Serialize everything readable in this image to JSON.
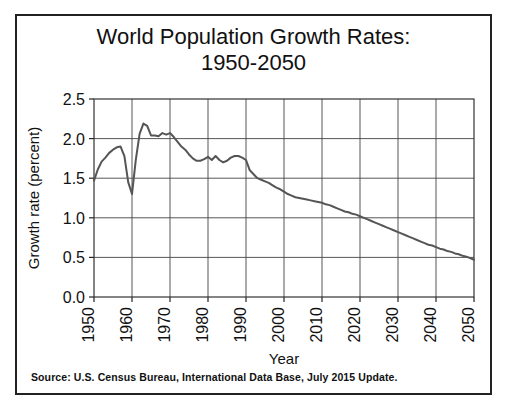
{
  "figure": {
    "title_line1": "World Population Growth Rates:",
    "title_line2": "1950-2050",
    "source_note": "Source: U.S. Census Bureau, International Data Base, July 2015 Update.",
    "frame_color": "#222222",
    "background_color": "#ffffff"
  },
  "chart_data": {
    "type": "line",
    "xlabel": "Year",
    "ylabel": "Growth rate (percent)",
    "xlim": [
      1950,
      2050
    ],
    "ylim": [
      0.0,
      2.5
    ],
    "grid": true,
    "legend": "none",
    "line_color": "#555555",
    "line_width": 2,
    "xticks": [
      1950,
      1960,
      1970,
      1980,
      1990,
      2000,
      2010,
      2020,
      2030,
      2040,
      2050
    ],
    "xtick_labels": [
      "1950",
      "1960",
      "1970",
      "1980",
      "1990",
      "2000",
      "2010",
      "2020",
      "2030",
      "2040",
      "2050"
    ],
    "xtick_rotation": 90,
    "yticks": [
      0.0,
      0.5,
      1.0,
      1.5,
      2.0,
      2.5
    ],
    "ytick_labels": [
      "0.0",
      "0.5",
      "1.0",
      "1.5",
      "2.0",
      "2.5"
    ],
    "series": [
      {
        "name": "World population growth rate",
        "x": [
          1950,
          1951,
          1952,
          1953,
          1954,
          1955,
          1956,
          1957,
          1958,
          1959,
          1960,
          1961,
          1962,
          1963,
          1964,
          1965,
          1966,
          1967,
          1968,
          1969,
          1970,
          1971,
          1972,
          1973,
          1974,
          1975,
          1976,
          1977,
          1978,
          1979,
          1980,
          1981,
          1982,
          1983,
          1984,
          1985,
          1986,
          1987,
          1988,
          1989,
          1990,
          1991,
          1992,
          1993,
          1994,
          1995,
          1996,
          1997,
          1998,
          1999,
          2000,
          2001,
          2002,
          2003,
          2004,
          2005,
          2006,
          2007,
          2008,
          2009,
          2010,
          2011,
          2012,
          2013,
          2014,
          2015,
          2016,
          2017,
          2018,
          2019,
          2020,
          2021,
          2022,
          2023,
          2024,
          2025,
          2026,
          2027,
          2028,
          2029,
          2030,
          2031,
          2032,
          2033,
          2034,
          2035,
          2036,
          2037,
          2038,
          2039,
          2040,
          2041,
          2042,
          2043,
          2044,
          2045,
          2046,
          2047,
          2048,
          2049,
          2050
        ],
        "y": [
          1.47,
          1.61,
          1.71,
          1.76,
          1.82,
          1.86,
          1.89,
          1.9,
          1.78,
          1.45,
          1.3,
          1.73,
          2.06,
          2.19,
          2.16,
          2.04,
          2.04,
          2.03,
          2.07,
          2.05,
          2.07,
          2.02,
          1.96,
          1.9,
          1.86,
          1.8,
          1.75,
          1.72,
          1.72,
          1.74,
          1.77,
          1.73,
          1.78,
          1.73,
          1.7,
          1.72,
          1.76,
          1.78,
          1.78,
          1.76,
          1.73,
          1.6,
          1.55,
          1.5,
          1.48,
          1.46,
          1.44,
          1.41,
          1.38,
          1.36,
          1.33,
          1.3,
          1.28,
          1.26,
          1.25,
          1.24,
          1.23,
          1.22,
          1.21,
          1.2,
          1.19,
          1.17,
          1.16,
          1.14,
          1.12,
          1.1,
          1.08,
          1.07,
          1.05,
          1.04,
          1.02,
          1.0,
          0.98,
          0.96,
          0.94,
          0.92,
          0.9,
          0.88,
          0.86,
          0.84,
          0.82,
          0.8,
          0.78,
          0.76,
          0.74,
          0.72,
          0.7,
          0.68,
          0.66,
          0.65,
          0.63,
          0.61,
          0.6,
          0.58,
          0.57,
          0.55,
          0.54,
          0.52,
          0.51,
          0.49,
          0.47
        ]
      }
    ]
  }
}
